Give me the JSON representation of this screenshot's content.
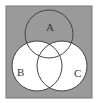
{
  "diagram": {
    "type": "venn",
    "sets": [
      {
        "label": "A",
        "cx": 49,
        "cy": 34,
        "r": 24
      },
      {
        "label": "B",
        "cx": 37,
        "cy": 66,
        "r": 25
      },
      {
        "label": "C",
        "cx": 62,
        "cy": 66,
        "r": 25
      }
    ],
    "shaded_region": "complement of (B ∪ C)",
    "colors": {
      "shade": "#9a9a9a",
      "unshaded": "#ffffff",
      "stroke": "#444444",
      "border": "#777777"
    },
    "labels": {
      "a": "A",
      "b": "B",
      "c": "C"
    }
  }
}
